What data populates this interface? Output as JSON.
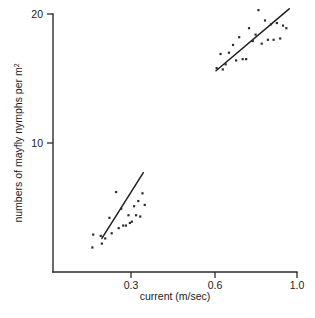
{
  "chart_data": {
    "type": "scatter",
    "title": "",
    "xlabel": "current (m/sec)",
    "ylabel": "numbers of mayfly nymphs per m²",
    "ylabel_plain": "numbers of mayfly nymphs per m",
    "ylabel_superscript": "2",
    "grid": false,
    "legend": "none",
    "xticks": [
      "0.3",
      "0.6",
      "1.0"
    ],
    "xtick_values": [
      0.3,
      0.6,
      1.0
    ],
    "yticks": [
      "10",
      "20"
    ],
    "ytick_values": [
      10,
      20
    ],
    "xlim": [
      0.12,
      1.02
    ],
    "ylim": [
      1.2,
      20.8
    ],
    "series": [
      {
        "name": "low-current cluster",
        "points": [
          [
            0.165,
            2.9
          ],
          [
            0.162,
            1.9
          ],
          [
            0.192,
            2.8
          ],
          [
            0.196,
            2.2
          ],
          [
            0.208,
            2.6
          ],
          [
            0.223,
            4.2
          ],
          [
            0.231,
            3.0
          ],
          [
            0.247,
            6.2
          ],
          [
            0.256,
            3.4
          ],
          [
            0.265,
            4.9
          ],
          [
            0.272,
            3.6
          ],
          [
            0.282,
            3.6
          ],
          [
            0.291,
            4.4
          ],
          [
            0.296,
            3.8
          ],
          [
            0.303,
            3.9
          ],
          [
            0.311,
            5.1
          ],
          [
            0.318,
            4.4
          ],
          [
            0.326,
            5.5
          ],
          [
            0.333,
            4.3
          ],
          [
            0.341,
            6.1
          ],
          [
            0.349,
            5.2
          ]
        ],
        "fit_line": {
          "x1": 0.196,
          "y1": 2.6,
          "x2": 0.344,
          "y2": 7.7
        }
      },
      {
        "name": "high-current cluster",
        "points": [
          [
            0.608,
            15.8
          ],
          [
            0.627,
            16.9
          ],
          [
            0.638,
            15.7
          ],
          [
            0.652,
            16.1
          ],
          [
            0.668,
            17.0
          ],
          [
            0.688,
            17.6
          ],
          [
            0.703,
            16.4
          ],
          [
            0.718,
            18.2
          ],
          [
            0.735,
            16.5
          ],
          [
            0.752,
            16.5
          ],
          [
            0.766,
            18.9
          ],
          [
            0.784,
            17.9
          ],
          [
            0.798,
            18.4
          ],
          [
            0.812,
            20.3
          ],
          [
            0.828,
            17.7
          ],
          [
            0.844,
            19.5
          ],
          [
            0.858,
            18.0
          ],
          [
            0.873,
            19.2
          ],
          [
            0.886,
            18.0
          ],
          [
            0.902,
            19.3
          ],
          [
            0.918,
            18.1
          ],
          [
            0.932,
            19.1
          ],
          [
            0.948,
            18.9
          ]
        ],
        "fit_line": {
          "x1": 0.605,
          "y1": 15.6,
          "x2": 0.962,
          "y2": 20.4
        }
      }
    ]
  }
}
